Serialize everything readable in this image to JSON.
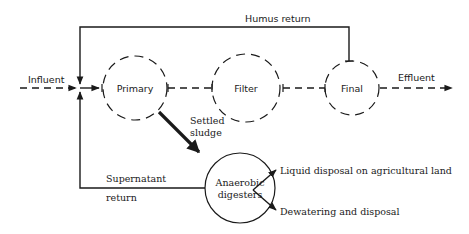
{
  "diagram": {
    "type": "process-flow",
    "nodes": {
      "primary": {
        "label": "Primary",
        "style": "dashed-circle"
      },
      "filter": {
        "label": "Filter",
        "style": "dashed-circle"
      },
      "final": {
        "label": "Final",
        "style": "dashed-circle"
      },
      "digesters": {
        "label_line1": "Anaerobic",
        "label_line2": "digesters",
        "style": "solid-circle"
      }
    },
    "flows": {
      "influent": {
        "label": "Influent",
        "style": "dashed-arrow"
      },
      "effluent": {
        "label": "Effluent",
        "style": "dashed-arrow"
      },
      "humus_return": {
        "label": "Humus return",
        "style": "solid-line"
      },
      "settled_sludge": {
        "label_line1": "Settled",
        "label_line2": "sludge",
        "style": "bold-arrow"
      },
      "supernatant_return": {
        "label_line1": "Supernatant",
        "label_line2": "return",
        "style": "solid-line"
      },
      "liquid_disposal": {
        "label": "Liquid disposal on agricultural land",
        "style": "solid-arrow"
      },
      "dewatering": {
        "label": "Dewatering and disposal",
        "style": "solid-arrow"
      }
    },
    "colors": {
      "stroke": "#1a1a1a",
      "background": "#ffffff"
    }
  }
}
